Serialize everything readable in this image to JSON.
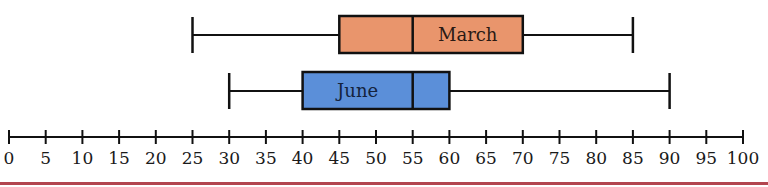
{
  "chart_data": {
    "type": "boxplot",
    "title": "",
    "xlabel": "",
    "ylabel": "",
    "orientation": "horizontal",
    "axis": {
      "min": 0,
      "max": 100,
      "tick_step": 5,
      "ticks": [
        0,
        5,
        10,
        15,
        20,
        25,
        30,
        35,
        40,
        45,
        50,
        55,
        60,
        65,
        70,
        75,
        80,
        85,
        90,
        95,
        100
      ],
      "tick_labels": [
        "0",
        "5",
        "10",
        "15",
        "20",
        "25",
        "30",
        "35",
        "40",
        "45",
        "50",
        "55",
        "60",
        "65",
        "70",
        "75",
        "80",
        "85",
        "90",
        "95",
        "100"
      ]
    },
    "grid": false,
    "series": [
      {
        "name": "March",
        "min": 25,
        "q1": 45,
        "median": 55,
        "q3": 70,
        "max": 85,
        "color": "#e9956c"
      },
      {
        "name": "June",
        "min": 30,
        "q1": 40,
        "median": 55,
        "q3": 60,
        "max": 90,
        "color": "#5b8fd9"
      }
    ]
  },
  "colors": {
    "stroke": "#111111",
    "label_text": "#2a1a14",
    "june_label_text": "#14233d",
    "bottom_rule": "#b3454f"
  }
}
